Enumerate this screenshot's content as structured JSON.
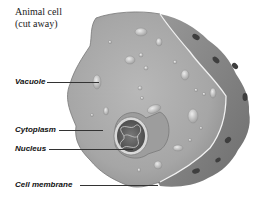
{
  "diagram": {
    "title_line1": "Animal cell",
    "title_line2": "(cut away)",
    "labels": [
      {
        "text": "Vacuole",
        "target": "vacuole"
      },
      {
        "text": "Cytoplasm",
        "target": "cytoplasm"
      },
      {
        "text": "Nucleus",
        "target": "nucleus"
      },
      {
        "text": "Cell membrane",
        "target": "cell-membrane"
      }
    ],
    "colors": {
      "cytoplasm": "#a9a9a9",
      "membrane_side": "#8a8a8a",
      "background": "#ffffff"
    }
  }
}
